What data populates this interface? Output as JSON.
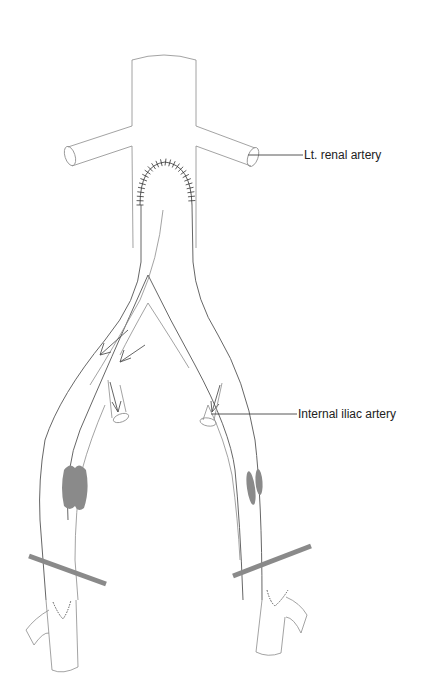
{
  "figure": {
    "type": "surgical-schematic",
    "labels": {
      "renal_artery": "Lt. renal artery",
      "internal_iliac": "Internal iliac artery"
    },
    "colors": {
      "vessel_outline": "#8c8c8c",
      "graft_outline": "#555555",
      "plaque": "#8a8a8a",
      "clamp": "#8a8a8a",
      "suture": "#333333",
      "label_text": "#222222"
    },
    "elements": [
      "aorta",
      "left-renal-artery",
      "right-renal-artery",
      "proximal-anastomosis-suture",
      "bifurcated-graft",
      "flow-arrows",
      "internal-iliac-stumps",
      "iliac-plaques",
      "vascular-clamps",
      "distal-anastomosis-sutures",
      "femoral-bifurcations"
    ]
  }
}
